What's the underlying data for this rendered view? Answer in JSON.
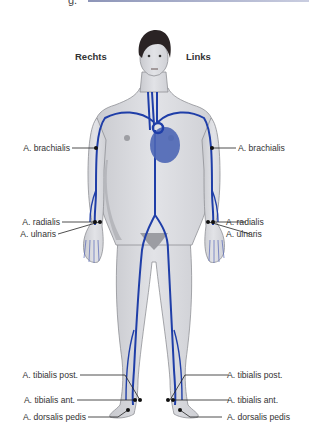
{
  "header": {
    "title_fragment": "g.",
    "accent_color": "#8d95b8"
  },
  "sides": {
    "right": "Rechts",
    "left": "Links"
  },
  "labels_left": [
    {
      "text": "A. brachialis",
      "y": 143
    },
    {
      "text": "A. radialis",
      "y": 217
    },
    {
      "text": "A. ulnaris",
      "y": 229
    },
    {
      "text": "A. tibialis post.",
      "y": 371
    },
    {
      "text": "A. tibialis ant.",
      "y": 396
    },
    {
      "text": "A. dorsalis pedis",
      "y": 413
    }
  ],
  "labels_right": [
    {
      "text": "A. brachialis",
      "y": 143
    },
    {
      "text": "A. radialis",
      "y": 217
    },
    {
      "text": "A. ulnaris",
      "y": 229
    },
    {
      "text": "A. tibialis post.",
      "y": 371
    },
    {
      "text": "A. tibialis ant.",
      "y": 396
    },
    {
      "text": "A. dorsalis pedis",
      "y": 413
    }
  ],
  "colors": {
    "artery": "#1f3ea8",
    "skin": "#dcdde2",
    "skin_shadow": "#b9babf",
    "heart": "#4c66b5",
    "line": "#222222"
  }
}
